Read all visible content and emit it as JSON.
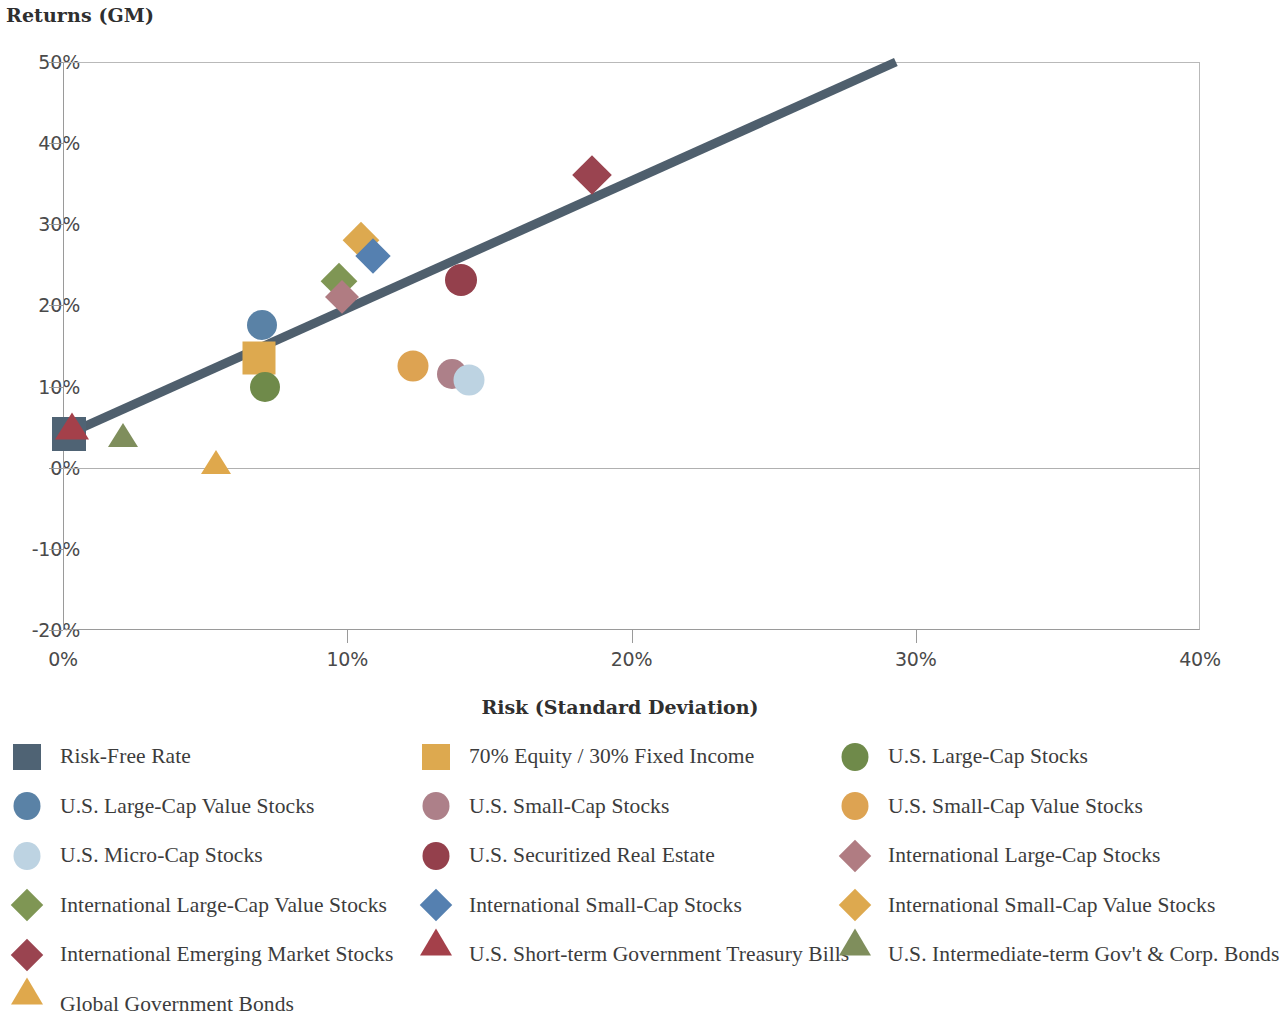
{
  "chart_data": {
    "type": "scatter",
    "title": "Returns (GM)",
    "xlabel": "Risk (Standard Deviation)",
    "ylabel": "Returns (GM)",
    "xlim": [
      0,
      40
    ],
    "ylim": [
      -20,
      50
    ],
    "x_ticks": [
      "0%",
      "10%",
      "20%",
      "30%",
      "40%"
    ],
    "x_tick_values": [
      0,
      10,
      20,
      30,
      40
    ],
    "y_ticks": [
      "50%",
      "40%",
      "30%",
      "20%",
      "10%",
      "0%",
      "-10%",
      "-20%"
    ],
    "y_tick_values": [
      50,
      40,
      30,
      20,
      10,
      0,
      -10,
      -20
    ],
    "grid": false,
    "legend_position": "bottom",
    "trendline": {
      "name": "Risk-return trendline",
      "color": "#4f5f6d",
      "width": 9,
      "x0": 0.2,
      "y0": 4.2,
      "x1": 29.3,
      "y1": 50.0
    },
    "points": [
      {
        "label": "Risk-Free Rate",
        "shape": "square",
        "color": "#4f6374",
        "x": 0.2,
        "y": 4.1,
        "size": 34
      },
      {
        "label": "U.S. Short-term Government Treasury Bills",
        "shape": "triangle",
        "color": "#a4404a",
        "x": 0.3,
        "y": 3.4,
        "size": 34
      },
      {
        "label": "U.S. Intermediate-term Gov't & Corp. Bonds",
        "shape": "triangle",
        "color": "#7f8e5c",
        "x": 2.1,
        "y": 2.5,
        "size": 30
      },
      {
        "label": "Global Government Bonds",
        "shape": "triangle",
        "color": "#dfa84c",
        "x": 5.4,
        "y": -0.8,
        "size": 30
      },
      {
        "label": "U.S. Large-Cap Value Stocks",
        "shape": "circle",
        "color": "#5a82a6",
        "x": 7.0,
        "y": 17.6,
        "size": 30
      },
      {
        "label": "70% Equity / 30% Fixed Income",
        "shape": "square",
        "color": "#dda94f",
        "x": 6.9,
        "y": 13.5,
        "size": 33
      },
      {
        "label": "U.S. Large-Cap Stocks",
        "shape": "circle",
        "color": "#6f8a4a",
        "x": 7.1,
        "y": 10.0,
        "size": 30
      },
      {
        "label": "International Large-Cap Value Stocks",
        "shape": "diamond",
        "color": "#7f9654",
        "x": 9.7,
        "y": 23.0,
        "size": 33
      },
      {
        "label": "International Large-Cap Stocks",
        "shape": "diamond",
        "color": "#b07c82",
        "x": 9.8,
        "y": 21.0,
        "size": 31
      },
      {
        "label": "International Small-Cap Value Stocks",
        "shape": "diamond",
        "color": "#dda94f",
        "x": 10.5,
        "y": 28.1,
        "size": 33
      },
      {
        "label": "International Small-Cap Stocks",
        "shape": "diamond",
        "color": "#5580b0",
        "x": 10.9,
        "y": 26.1,
        "size": 32
      },
      {
        "label": "U.S. Small-Cap Value Stocks",
        "shape": "circle",
        "color": "#dda352",
        "x": 12.3,
        "y": 12.5,
        "size": 31
      },
      {
        "label": "U.S. Small-Cap Stocks",
        "shape": "circle",
        "color": "#ad8089",
        "x": 13.7,
        "y": 11.5,
        "size": 30
      },
      {
        "label": "U.S. Micro-Cap Stocks",
        "shape": "circle",
        "color": "#bdd3e2",
        "x": 14.3,
        "y": 10.8,
        "size": 31
      },
      {
        "label": "U.S. Securitized Real Estate",
        "shape": "circle",
        "color": "#94404c",
        "x": 14.0,
        "y": 23.1,
        "size": 32
      },
      {
        "label": "International Emerging Market Stocks",
        "shape": "diamond",
        "color": "#9a4450",
        "x": 18.6,
        "y": 36.1,
        "size": 36
      }
    ]
  },
  "legend": {
    "rows": [
      [
        {
          "label": "Risk-Free Rate",
          "shape": "square",
          "color": "#4f6374"
        },
        {
          "label": "70% Equity / 30% Fixed Income",
          "shape": "square",
          "color": "#dda94f"
        },
        {
          "label": "U.S. Large-Cap Stocks",
          "shape": "circle",
          "color": "#6f8a4a"
        }
      ],
      [
        {
          "label": "U.S. Large-Cap Value Stocks",
          "shape": "circle",
          "color": "#5a82a6"
        },
        {
          "label": "U.S. Small-Cap Stocks",
          "shape": "circle",
          "color": "#ad8089"
        },
        {
          "label": "U.S. Small-Cap Value Stocks",
          "shape": "circle",
          "color": "#dda352"
        }
      ],
      [
        {
          "label": "U.S. Micro-Cap Stocks",
          "shape": "circle",
          "color": "#bdd3e2"
        },
        {
          "label": "U.S. Securitized Real Estate",
          "shape": "circle",
          "color": "#94404c"
        },
        {
          "label": "International Large-Cap Stocks",
          "shape": "diamond",
          "color": "#b07c82"
        }
      ],
      [
        {
          "label": "International Large-Cap Value Stocks",
          "shape": "diamond",
          "color": "#7f9654"
        },
        {
          "label": "International Small-Cap Stocks",
          "shape": "diamond",
          "color": "#5580b0"
        },
        {
          "label": "International Small-Cap Value Stocks",
          "shape": "diamond",
          "color": "#dda94f"
        }
      ],
      [
        {
          "label": "International Emerging Market Stocks",
          "shape": "diamond",
          "color": "#9a4450"
        },
        {
          "label": "U.S. Short-term Government Treasury Bills",
          "shape": "triangle",
          "color": "#a4404a"
        },
        {
          "label": "U.S. Intermediate-term Gov't & Corp. Bonds",
          "shape": "triangle",
          "color": "#7f8e5c"
        }
      ],
      [
        {
          "label": "Global Government Bonds",
          "shape": "triangle",
          "color": "#dfa84c"
        }
      ]
    ]
  }
}
